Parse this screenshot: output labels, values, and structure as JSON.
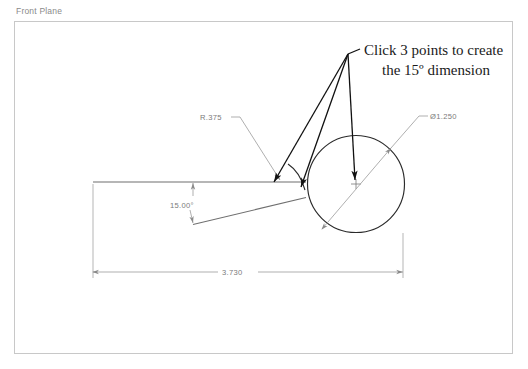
{
  "plane": {
    "label": "Front Plane"
  },
  "instruction": {
    "line1": "Click 3 points to create",
    "line2": "the 15º dimension"
  },
  "annotations": {
    "radius": "R.375",
    "diameter": "Ø1.250",
    "angle": "15.00°",
    "length": "3.730"
  },
  "colors": {
    "border": "#c8c8c8",
    "geometry": "#808080",
    "dimension": "#9a9a9a",
    "leader": "#1a1a1a",
    "text": "#7a7a7a",
    "instruction_text": "#1a1a1a",
    "plane_label": "#8a8a8a"
  },
  "geometry_data": {
    "type": "technical-drawing",
    "top_line": {
      "x1": 93,
      "y1": 182,
      "x2": 305,
      "y2": 182
    },
    "angled_line": {
      "x1": 193,
      "y1": 224,
      "x2": 305,
      "y2": 198
    },
    "circle": {
      "cx": 356,
      "cy": 184,
      "r": 48
    },
    "diameter_line": {
      "x1": 322,
      "y1": 230,
      "x2": 420,
      "y2": 116
    },
    "radius_leader": {
      "x1": 240,
      "y1": 116,
      "x2": 281,
      "y2": 181
    },
    "angle_dim_value": "15.00°",
    "length_dim_value": "3.730",
    "leader_apex": {
      "x": 348,
      "y": 53
    },
    "leader_targets": [
      {
        "x": 275,
        "y": 183
      },
      {
        "x": 302,
        "y": 188
      },
      {
        "x": 356,
        "y": 184
      }
    ]
  }
}
